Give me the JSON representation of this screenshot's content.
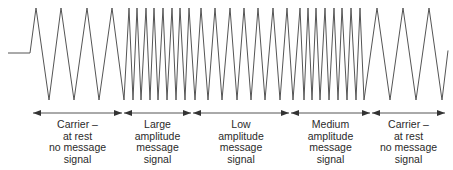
{
  "diagram": {
    "colors": {
      "line": "#555555",
      "text": "#2a2a2a",
      "background": "#ffffff"
    },
    "waveform": {
      "baseline": {
        "x1": 8,
        "x2": 30,
        "y": 53
      },
      "peak_y": 8,
      "trough_y": 100,
      "points_x": [
        30,
        36,
        49,
        61,
        74,
        87,
        99,
        112,
        124,
        129,
        133,
        137,
        141,
        146,
        150,
        154,
        158,
        163,
        167,
        172,
        176,
        180,
        185,
        189,
        195,
        201,
        208,
        215,
        222,
        230,
        237,
        244,
        251,
        258,
        265,
        273,
        280,
        287,
        293,
        300,
        304,
        308,
        312,
        316,
        320,
        325,
        329,
        334,
        338,
        342,
        347,
        351,
        356,
        360,
        364,
        377,
        390,
        403,
        416,
        429,
        442,
        448
      ]
    },
    "arrow_line_y": 113,
    "segments": [
      {
        "x1": 32,
        "x2": 123,
        "lines": [
          "Carrier –",
          "at rest",
          "no message",
          "signal"
        ]
      },
      {
        "x1": 123,
        "x2": 192,
        "lines": [
          "Large",
          "amplitude",
          "message",
          "signal"
        ]
      },
      {
        "x1": 192,
        "x2": 290,
        "lines": [
          "Low",
          "amplitude",
          "message",
          "signal"
        ]
      },
      {
        "x1": 290,
        "x2": 371,
        "lines": [
          "Medium",
          "amplitude",
          "message",
          "signal"
        ]
      },
      {
        "x1": 371,
        "x2": 446,
        "lines": [
          "Carrier –",
          "at rest",
          "no message",
          "signal"
        ]
      }
    ]
  }
}
